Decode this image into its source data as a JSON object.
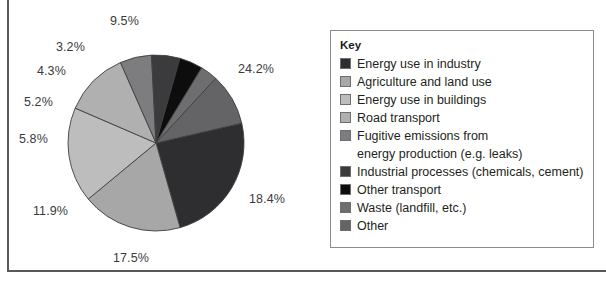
{
  "figure": {
    "title": "",
    "legend_title": "Key"
  },
  "chart_data": {
    "type": "pie",
    "title": "",
    "xlabel": "",
    "ylabel": "",
    "legend_position": "right",
    "legend_title": "Key",
    "units": "percent",
    "start_angle_deg": -13,
    "direction": "clockwise",
    "categories": [
      "Energy use in industry",
      "Agriculture and land use",
      "Energy use in buildings",
      "Road transport",
      "Fugitive emissions from energy production (e.g. leaks)",
      "Industrial processes (chemicals, cement)",
      "Other transport",
      "Waste (landfill, etc.)",
      "Other"
    ],
    "values": [
      24.2,
      18.4,
      17.5,
      11.9,
      5.8,
      5.2,
      4.3,
      3.2,
      9.5
    ],
    "value_labels": [
      "24.2%",
      "18.4%",
      "17.5%",
      "11.9%",
      "5.8%",
      "5.2%",
      "4.3%",
      "3.2%",
      "9.5%"
    ],
    "colors": [
      "#2e2e30",
      "#a7a7a7",
      "#bdbdbd",
      "#b0b0b0",
      "#7d7d7f",
      "#3b3b3d",
      "#0d0d0d",
      "#6e6e70",
      "#646466"
    ],
    "total": 100.0
  },
  "legend": {
    "title": "Key",
    "items": [
      {
        "label": "Energy use in industry",
        "color": "#2e2e30",
        "value": "24.2%"
      },
      {
        "label": "Agriculture and land use",
        "color": "#a7a7a7",
        "value": "18.4%"
      },
      {
        "label": "Energy use in buildings",
        "color": "#bdbdbd",
        "value": "17.5%"
      },
      {
        "label": "Road transport",
        "color": "#b0b0b0",
        "value": "11.9%"
      },
      {
        "label": "Fugitive emissions from",
        "label_cont": "energy production (e.g. leaks)",
        "color": "#7d7d7f",
        "value": "5.8%"
      },
      {
        "label": "Industrial processes (chemicals, cement)",
        "color": "#3b3b3d",
        "value": "5.2%"
      },
      {
        "label": "Other transport",
        "color": "#0d0d0d",
        "value": "4.3%"
      },
      {
        "label": "Waste (landfill, etc.)",
        "color": "#6e6e70",
        "value": "3.2%"
      },
      {
        "label": "Other",
        "color": "#646466",
        "value": "9.5%"
      }
    ]
  },
  "pie_labels": [
    {
      "text": "9.5%",
      "left": 110,
      "top": 14
    },
    {
      "text": "24.2%",
      "left": 238,
      "top": 62
    },
    {
      "text": "18.4%",
      "left": 249,
      "top": 192
    },
    {
      "text": "17.5%",
      "left": 113,
      "top": 251
    },
    {
      "text": "11.9%",
      "left": 33,
      "top": 204
    },
    {
      "text": "5.8%",
      "left": 19,
      "top": 132
    },
    {
      "text": "5.2%",
      "left": 24,
      "top": 95
    },
    {
      "text": "4.3%",
      "left": 37,
      "top": 64
    },
    {
      "text": "3.2%",
      "left": 56,
      "top": 40
    }
  ]
}
